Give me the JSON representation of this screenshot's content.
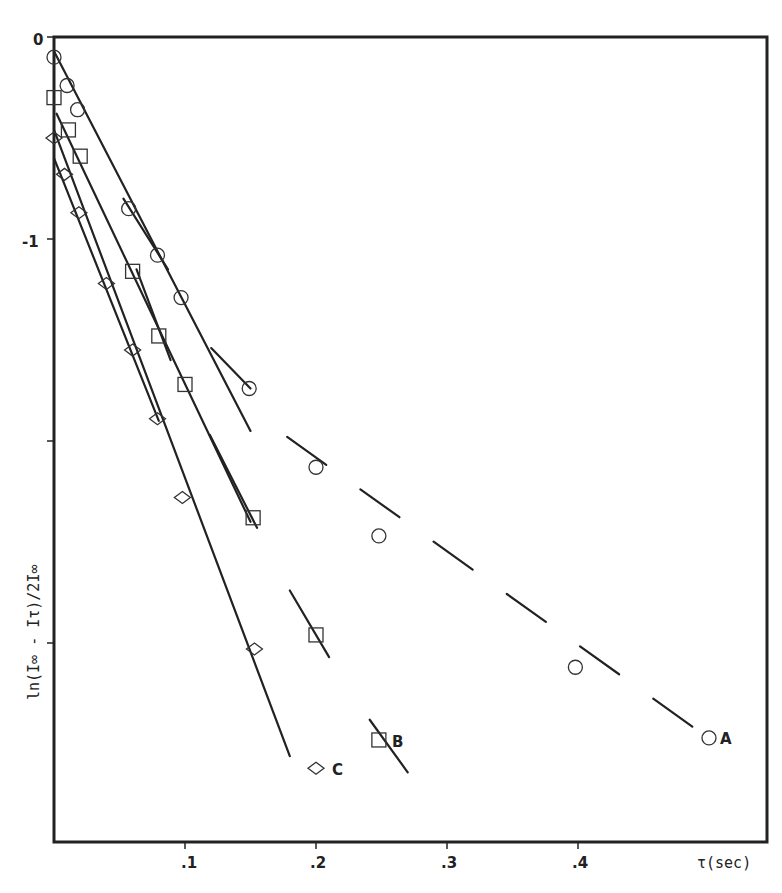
{
  "chart_data": {
    "type": "scatter",
    "title": "",
    "xlabel": "τ(sec)",
    "ylabel": "ln(I∞ - Iτ)/2I∞",
    "xlim": [
      0,
      0.545
    ],
    "ylim": [
      -3.98,
      0
    ],
    "grid": false,
    "legend": "inline labels at series ends",
    "x_ticks": [
      {
        "value": 0.1,
        "label": ".1"
      },
      {
        "value": 0.2,
        "label": ".2"
      },
      {
        "value": 0.3,
        "label": ".3"
      },
      {
        "value": 0.4,
        "label": ".4"
      }
    ],
    "y_ticks": [
      {
        "value": 0,
        "label": "0"
      },
      {
        "value": -1,
        "label": "-1"
      },
      {
        "value": -2,
        "label": ""
      },
      {
        "value": -3,
        "label": ""
      }
    ],
    "series": [
      {
        "name": "A",
        "marker": "circle",
        "x": [
          0.0,
          0.01,
          0.018,
          0.057,
          0.079,
          0.097,
          0.149,
          0.2,
          0.248,
          0.398,
          0.5
        ],
        "y": [
          -0.1,
          -0.24,
          -0.36,
          -0.85,
          -1.08,
          -1.29,
          -1.74,
          -2.13,
          -2.47,
          -3.12,
          -3.47
        ],
        "fit_lines": [
          {
            "style": "solid",
            "from": [
              0.0,
              -0.07
            ],
            "to": [
              0.15,
              -1.95
            ]
          },
          {
            "style": "solid",
            "from": [
              0.053,
              -0.8
            ],
            "to": [
              0.087,
              -1.15
            ]
          },
          {
            "style": "solid",
            "from": [
              0.12,
              -1.54
            ],
            "to": [
              0.15,
              -1.74
            ]
          },
          {
            "style": "dashed",
            "from": [
              0.178,
              -1.98
            ],
            "to": [
              0.508,
              -3.51
            ]
          }
        ]
      },
      {
        "name": "B",
        "marker": "square",
        "x": [
          0.0,
          0.011,
          0.02,
          0.06,
          0.08,
          0.1,
          0.152,
          0.2,
          0.248
        ],
        "y": [
          -0.3,
          -0.46,
          -0.59,
          -1.16,
          -1.48,
          -1.72,
          -2.38,
          -2.96,
          -3.48
        ],
        "fit_lines": [
          {
            "style": "solid",
            "from": [
              0.002,
              -0.38
            ],
            "to": [
              0.15,
              -2.4
            ]
          },
          {
            "style": "solid",
            "from": [
              0.063,
              -1.15
            ],
            "to": [
              0.089,
              -1.6
            ]
          },
          {
            "style": "solid",
            "from": [
              0.119,
              -1.97
            ],
            "to": [
              0.155,
              -2.43
            ]
          },
          {
            "style": "solid",
            "from": [
              0.18,
              -2.74
            ],
            "to": [
              0.21,
              -3.07
            ]
          },
          {
            "style": "solid",
            "from": [
              0.241,
              -3.38
            ],
            "to": [
              0.27,
              -3.64
            ]
          }
        ]
      },
      {
        "name": "C",
        "marker": "diamond",
        "x": [
          0.0,
          0.008,
          0.019,
          0.04,
          0.06,
          0.079,
          0.098,
          0.153,
          0.2
        ],
        "y": [
          -0.5,
          -0.68,
          -0.87,
          -1.22,
          -1.55,
          -1.89,
          -2.28,
          -3.03,
          -3.62
        ],
        "fit_lines": [
          {
            "style": "solid",
            "from": [
              0.0,
              -0.46
            ],
            "to": [
              0.18,
              -3.56
            ]
          },
          {
            "style": "solid",
            "from": [
              0.0,
              -0.6
            ],
            "to": [
              0.08,
              -1.9
            ]
          }
        ]
      }
    ]
  },
  "labels": {
    "y_axis_title": "ln(I∞ - Iτ)/2I∞",
    "x_axis_title": "τ(sec)",
    "series_a": "A",
    "series_b": "B",
    "series_c": "C",
    "x_ticks": [
      ".1",
      ".2",
      ".3",
      ".4"
    ],
    "y_ticks": [
      "0",
      "-1"
    ]
  }
}
